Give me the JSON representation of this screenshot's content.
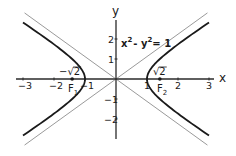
{
  "chart_data": {
    "type": "line",
    "title": "",
    "xlabel": "x",
    "ylabel": "y",
    "xlim": [
      -3,
      3
    ],
    "ylim": [
      -2.9,
      2.9
    ],
    "grid": false,
    "legend": "none",
    "x_ticks": [
      {
        "value": -3,
        "label": "−3"
      },
      {
        "value": -2,
        "label": "−2"
      },
      {
        "value": -1,
        "label": "−1"
      },
      {
        "value": 1,
        "label": "1"
      },
      {
        "value": 2,
        "label": "2"
      },
      {
        "value": 3,
        "label": "3"
      }
    ],
    "y_ticks": [
      {
        "value": 2,
        "label": "2"
      },
      {
        "value": 1,
        "label": "1"
      },
      {
        "value": -1,
        "label": "−1"
      },
      {
        "value": -2,
        "label": "−2"
      }
    ],
    "series": [
      {
        "name": "hyperbola x^2 - y^2 = 1",
        "equation": "x^2 - y^2 = 1",
        "style": "solid-black",
        "x_range": [
          -3,
          3
        ],
        "branches": [
          "right",
          "left"
        ]
      },
      {
        "name": "asymptote y = x",
        "equation": "y = x",
        "style": "thin-gray",
        "x_range": [
          -2.95,
          2.95
        ]
      },
      {
        "name": "asymptote y = -x",
        "equation": "y = -x",
        "style": "thin-gray",
        "x_range": [
          -2.95,
          2.95
        ]
      }
    ],
    "points": [
      {
        "name": "F1",
        "x": -1.41421356,
        "y": 0,
        "label": "F",
        "sub": "1",
        "value_label": "−√2"
      },
      {
        "name": "F2",
        "x": 1.41421356,
        "y": 0,
        "label": "F",
        "sub": "2",
        "value_label": "√2"
      }
    ],
    "annotations": [
      {
        "text": "x",
        "sup": "2",
        "text2": "- y",
        "sup2": "2",
        "text3": "= 1",
        "full": "x² - y² = 1",
        "at_x": 0.1,
        "at_y": 1.75
      }
    ],
    "colors": {
      "curve": "#1a1a1a",
      "asymptote": "#9a9a9a",
      "axis": "#2a2a2a"
    }
  }
}
